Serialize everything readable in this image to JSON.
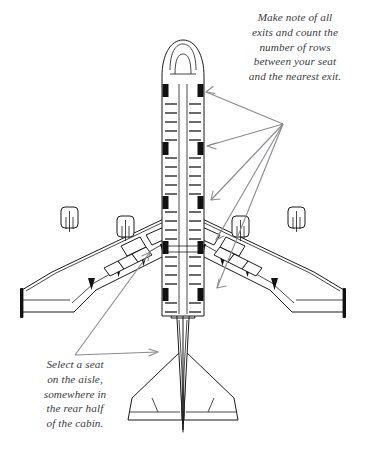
{
  "illustration": {
    "title": "Airplane cabin safety diagram",
    "subject": "wide-body airliner top view",
    "line_color": "#1b1b1b",
    "fill_color": "#ffffff",
    "exit_marker_color": "#111111",
    "arrow_color": "#8a8a90",
    "text_color": "#3b3b44"
  },
  "annotations": {
    "exits_note": {
      "name": "exits-note",
      "lines": [
        "Make note of all",
        "exits and count the",
        "number of rows",
        "between your seat",
        "and the nearest exit."
      ]
    },
    "seat_note": {
      "name": "seat-note",
      "lines": [
        "Select a seat",
        "on the aisle,",
        "somewhere in",
        "the rear half",
        "of the cabin."
      ]
    }
  },
  "aircraft": {
    "exit_pairs": 5,
    "exit_rows_y": [
      88,
      145,
      200,
      245,
      290
    ],
    "engines_per_wing": 2,
    "winglets": 2,
    "seat_rows_visible": 34,
    "aisle": "center single aisle shown between two seat columns"
  },
  "pointers": {
    "exit_arrow_origin": {
      "x": 283,
      "y": 124
    },
    "exit_arrow_targets": [
      {
        "x": 203,
        "y": 92
      },
      {
        "x": 200,
        "y": 146
      },
      {
        "x": 208,
        "y": 200
      },
      {
        "x": 212,
        "y": 240
      },
      {
        "x": 214,
        "y": 288
      }
    ],
    "seat_arrow_origin": {
      "x": 75,
      "y": 355
    },
    "seat_arrow_targets": [
      {
        "x": 148,
        "y": 252
      },
      {
        "x": 155,
        "y": 352
      }
    ]
  }
}
